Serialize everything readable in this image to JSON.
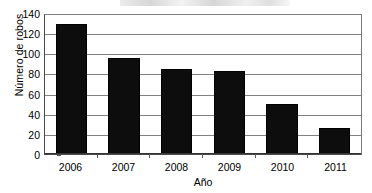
{
  "chart_data": {
    "type": "bar",
    "title": "",
    "categories": [
      "2006",
      "2007",
      "2008",
      "2009",
      "2010",
      "2011"
    ],
    "values": [
      129,
      95,
      84,
      82,
      50,
      26
    ],
    "series": [
      {
        "name": "Número de robos",
        "values": [
          129,
          95,
          84,
          82,
          50,
          26
        ]
      }
    ],
    "xlabel": "Año",
    "ylabel": "Número de robos",
    "ylim": [
      0,
      140
    ],
    "yticks": [
      0,
      20,
      40,
      60,
      80,
      100,
      120,
      140
    ],
    "ytick_labels": [
      "0",
      "20",
      "40",
      "60",
      "80",
      "100",
      "120",
      "140"
    ],
    "grid": "horizontal",
    "legend": "none",
    "bar_color": "#0d0d0d",
    "grid_color": "#808080",
    "axis_color": "#333333"
  },
  "axes": {
    "y_title": "Número de robos",
    "x_title": "Año"
  },
  "title_strip": {
    "text": ""
  }
}
